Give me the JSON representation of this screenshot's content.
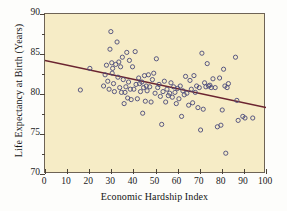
{
  "chart_data": {
    "type": "scatter",
    "title": "",
    "xlabel": "Economic Hardship Index",
    "ylabel": "Life Expectancy at Birth (Years)",
    "xlim": [
      0,
      100
    ],
    "ylim": [
      70,
      90
    ],
    "xticks": [
      0,
      10,
      20,
      30,
      40,
      50,
      60,
      70,
      80,
      90,
      100
    ],
    "yticks": [
      70,
      75,
      80,
      85,
      90
    ],
    "y_minor_ticks": [
      72.5,
      77.5,
      82.5,
      87.5
    ],
    "grid": false,
    "legend": "none",
    "marker": "open-circle",
    "marker_color": "#4a4a7a",
    "plot_background": "#f6ecc6",
    "frame_color": "#6e6355",
    "trendline": {
      "type": "line",
      "color": "#6b2430",
      "x": [
        0,
        100
      ],
      "y": [
        84.2,
        78.3
      ],
      "label": "least-squares regression line"
    },
    "points": [
      [
        16.0,
        80.5
      ],
      [
        20.3,
        83.2
      ],
      [
        26.5,
        81.0
      ],
      [
        27.2,
        82.4
      ],
      [
        27.8,
        83.6
      ],
      [
        28.4,
        81.6
      ],
      [
        29.0,
        80.6
      ],
      [
        29.4,
        85.6
      ],
      [
        29.8,
        87.8
      ],
      [
        30.2,
        83.9
      ],
      [
        30.4,
        82.6
      ],
      [
        30.6,
        83.2
      ],
      [
        31.0,
        81.3
      ],
      [
        31.4,
        80.3
      ],
      [
        32.0,
        83.7
      ],
      [
        32.6,
        86.5
      ],
      [
        33.0,
        82.1
      ],
      [
        33.4,
        84.0
      ],
      [
        33.8,
        80.8
      ],
      [
        34.2,
        83.4
      ],
      [
        34.6,
        80.2
      ],
      [
        35.0,
        84.6
      ],
      [
        35.4,
        81.8
      ],
      [
        35.8,
        78.8
      ],
      [
        36.2,
        80.2
      ],
      [
        36.6,
        80.9
      ],
      [
        37.0,
        85.2
      ],
      [
        37.4,
        79.5
      ],
      [
        37.8,
        81.5
      ],
      [
        38.2,
        84.2
      ],
      [
        38.6,
        80.6
      ],
      [
        39.0,
        79.3
      ],
      [
        39.6,
        83.4
      ],
      [
        40.2,
        80.6
      ],
      [
        40.8,
        85.3
      ],
      [
        41.2,
        81.2
      ],
      [
        41.8,
        79.4
      ],
      [
        42.4,
        82.0
      ],
      [
        42.8,
        81.3
      ],
      [
        43.2,
        80.3
      ],
      [
        43.8,
        81.5
      ],
      [
        44.2,
        77.6
      ],
      [
        44.6,
        80.8
      ],
      [
        45.0,
        82.3
      ],
      [
        45.4,
        79.1
      ],
      [
        45.8,
        81.0
      ],
      [
        46.2,
        80.4
      ],
      [
        46.8,
        82.4
      ],
      [
        47.4,
        80.9
      ],
      [
        48.0,
        79.0
      ],
      [
        48.6,
        81.8
      ],
      [
        49.2,
        82.6
      ],
      [
        49.8,
        80.1
      ],
      [
        50.4,
        84.4
      ],
      [
        51.0,
        80.8
      ],
      [
        51.6,
        81.2
      ],
      [
        52.2,
        79.7
      ],
      [
        52.8,
        76.2
      ],
      [
        53.4,
        80.3
      ],
      [
        54.0,
        81.6
      ],
      [
        54.6,
        79.0
      ],
      [
        55.2,
        80.6
      ],
      [
        55.8,
        79.8
      ],
      [
        56.4,
        80.1
      ],
      [
        57.0,
        81.4
      ],
      [
        57.6,
        79.6
      ],
      [
        58.2,
        80.9
      ],
      [
        58.8,
        80.2
      ],
      [
        59.4,
        78.8
      ],
      [
        60.0,
        80.7
      ],
      [
        60.6,
        79.4
      ],
      [
        61.2,
        81.0
      ],
      [
        61.8,
        77.2
      ],
      [
        62.4,
        80.4
      ],
      [
        63.0,
        79.9
      ],
      [
        63.6,
        82.2
      ],
      [
        64.2,
        80.1
      ],
      [
        65.0,
        78.6
      ],
      [
        65.6,
        81.7
      ],
      [
        66.2,
        80.6
      ],
      [
        66.8,
        78.9
      ],
      [
        67.4,
        82.3
      ],
      [
        68.0,
        80.2
      ],
      [
        68.6,
        81.0
      ],
      [
        69.2,
        78.3
      ],
      [
        69.8,
        80.8
      ],
      [
        70.4,
        75.5
      ],
      [
        71.0,
        85.1
      ],
      [
        71.6,
        78.1
      ],
      [
        72.2,
        81.4
      ],
      [
        72.8,
        80.9
      ],
      [
        73.4,
        83.8
      ],
      [
        74.0,
        81.0
      ],
      [
        74.6,
        81.1
      ],
      [
        75.2,
        80.8
      ],
      [
        76.0,
        81.9
      ],
      [
        77.0,
        80.8
      ],
      [
        78.0,
        75.9
      ],
      [
        79.0,
        82.0
      ],
      [
        79.6,
        76.1
      ],
      [
        80.2,
        78.0
      ],
      [
        80.8,
        83.1
      ],
      [
        81.4,
        81.0
      ],
      [
        81.8,
        72.6
      ],
      [
        82.4,
        80.8
      ],
      [
        83.0,
        81.3
      ],
      [
        86.2,
        84.6
      ],
      [
        86.8,
        79.2
      ],
      [
        87.4,
        76.7
      ],
      [
        89.5,
        77.2
      ],
      [
        90.5,
        77.0
      ],
      [
        94.0,
        77.0
      ]
    ]
  },
  "axes": {
    "x_tick_labels": [
      "0",
      "10",
      "20",
      "30",
      "40",
      "50",
      "60",
      "70",
      "80",
      "90",
      "100"
    ],
    "y_tick_labels": [
      "70",
      "75",
      "80",
      "85",
      "90"
    ],
    "x_title": "Economic Hardship Index",
    "y_title": "Life Expectancy at Birth (Years)"
  }
}
